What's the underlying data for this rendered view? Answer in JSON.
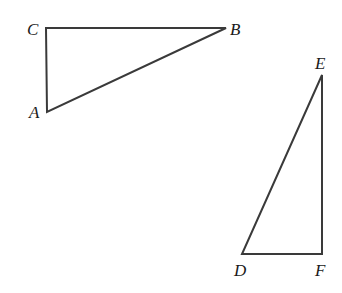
{
  "diagram": {
    "type": "geometry",
    "triangles": [
      {
        "name": "ABC",
        "vertices": {
          "A": {
            "label": "A",
            "x": 47,
            "y": 112
          },
          "B": {
            "label": "B",
            "x": 226,
            "y": 28
          },
          "C": {
            "label": "C",
            "x": 46,
            "y": 28
          }
        },
        "right_angle_at": "C"
      },
      {
        "name": "DEF",
        "vertices": {
          "D": {
            "label": "D",
            "x": 242,
            "y": 254
          },
          "E": {
            "label": "E",
            "x": 322,
            "y": 75
          },
          "F": {
            "label": "F",
            "x": 322,
            "y": 254
          }
        },
        "right_angle_at": "F"
      }
    ],
    "labels": {
      "A": "A",
      "B": "B",
      "C": "C",
      "D": "D",
      "E": "E",
      "F": "F"
    },
    "colors": {
      "stroke": "#3a3a3a",
      "text": "#1a1a1a",
      "background": "#ffffff"
    }
  }
}
